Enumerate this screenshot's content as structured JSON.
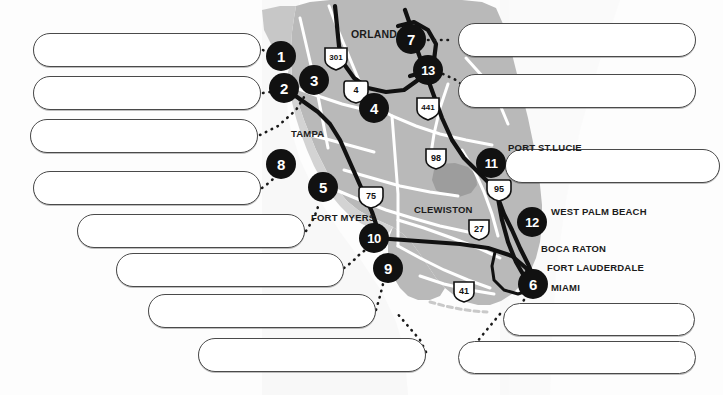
{
  "document": {
    "title": "Florida Numbered Location Map with Blank Callouts",
    "type": "map"
  },
  "map": {
    "region_name": "Florida",
    "land_color": "#b9b9b9",
    "land_highlight_color": "#a3a3a3",
    "water_color": "#f2f2f2",
    "road_major_color": "#111111",
    "road_minor_color": "#ffffff",
    "marker_color": "#111111",
    "marker_text_color": "#ffffff",
    "callout_fill": "#ffffff",
    "callout_border": "#4a4a4a",
    "label_color": "#1b1b1b"
  },
  "markers": [
    {
      "id": "marker-1",
      "label": "1",
      "x": 281,
      "y": 56,
      "r": 15
    },
    {
      "id": "marker-2",
      "label": "2",
      "x": 284,
      "y": 88,
      "r": 15
    },
    {
      "id": "marker-3",
      "label": "3",
      "x": 314,
      "y": 80,
      "r": 15
    },
    {
      "id": "marker-4",
      "label": "4",
      "x": 374,
      "y": 108,
      "r": 15
    },
    {
      "id": "marker-5",
      "label": "5",
      "x": 323,
      "y": 187,
      "r": 15
    },
    {
      "id": "marker-6",
      "label": "6",
      "x": 533,
      "y": 284,
      "r": 15
    },
    {
      "id": "marker-7",
      "label": "7",
      "x": 411,
      "y": 39,
      "r": 15
    },
    {
      "id": "marker-8",
      "label": "8",
      "x": 281,
      "y": 164,
      "r": 15
    },
    {
      "id": "marker-9",
      "label": "9",
      "x": 388,
      "y": 268,
      "r": 15
    },
    {
      "id": "marker-10",
      "label": "10",
      "x": 374,
      "y": 238,
      "r": 15
    },
    {
      "id": "marker-11",
      "label": "11",
      "x": 491,
      "y": 163,
      "r": 15
    },
    {
      "id": "marker-12",
      "label": "12",
      "x": 532,
      "y": 222,
      "r": 15
    },
    {
      "id": "marker-13",
      "label": "13",
      "x": 428,
      "y": 70,
      "r": 15
    }
  ],
  "city_labels": [
    {
      "id": "city-orlando",
      "text": "ORLANDO",
      "x": 351,
      "y": 28,
      "size": 10.5
    },
    {
      "id": "city-tampa",
      "text": "TAMPA",
      "x": 291,
      "y": 128,
      "size": 9.5
    },
    {
      "id": "city-fort-myers",
      "text": "FORT MYERS",
      "x": 311,
      "y": 212,
      "size": 9.5
    },
    {
      "id": "city-clewiston",
      "text": "CLEWISTON",
      "x": 414,
      "y": 204,
      "size": 9.5
    },
    {
      "id": "city-port-st-lucie",
      "text": "PORT ST.LUCIE",
      "x": 508,
      "y": 142,
      "size": 9.5
    },
    {
      "id": "city-west-palm-beach",
      "text": "WEST PALM BEACH",
      "x": 551,
      "y": 206,
      "size": 9.5
    },
    {
      "id": "city-boca-raton",
      "text": "BOCA RATON",
      "x": 541,
      "y": 243,
      "size": 9.5
    },
    {
      "id": "city-fort-lauderdale",
      "text": "FORT LAUDERDALE",
      "x": 547,
      "y": 262,
      "size": 9.5
    },
    {
      "id": "city-miami",
      "text": "MIAMI",
      "x": 551,
      "y": 282,
      "size": 9.5
    }
  ],
  "highway_shields": [
    {
      "id": "shield-301",
      "label": "301",
      "x": 336,
      "y": 57,
      "kind": "us",
      "w": 22,
      "h": 20
    },
    {
      "id": "shield-4",
      "label": "4",
      "x": 356,
      "y": 90,
      "kind": "interstate",
      "w": 20,
      "h": 19
    },
    {
      "id": "shield-441",
      "label": "441",
      "x": 428,
      "y": 107,
      "kind": "us",
      "w": 22,
      "h": 20
    },
    {
      "id": "shield-98",
      "label": "98",
      "x": 436,
      "y": 158,
      "kind": "us",
      "w": 20,
      "h": 19
    },
    {
      "id": "shield-95",
      "label": "95",
      "x": 499,
      "y": 189,
      "kind": "interstate",
      "w": 20,
      "h": 19
    },
    {
      "id": "shield-27",
      "label": "27",
      "x": 479,
      "y": 229,
      "kind": "us",
      "w": 20,
      "h": 19
    },
    {
      "id": "shield-75",
      "label": "75",
      "x": 371,
      "y": 196,
      "kind": "interstate",
      "w": 20,
      "h": 19
    },
    {
      "id": "shield-41",
      "label": "41",
      "x": 464,
      "y": 291,
      "kind": "us",
      "w": 20,
      "h": 19
    }
  ],
  "callouts": [
    {
      "id": "callout-1",
      "text": "",
      "placeholder": "",
      "x": 33,
      "y": 33,
      "w": 228,
      "h": 34,
      "side": "left",
      "marker": "1"
    },
    {
      "id": "callout-2",
      "text": "",
      "placeholder": "",
      "x": 33,
      "y": 76,
      "w": 228,
      "h": 34,
      "side": "left",
      "marker": "2"
    },
    {
      "id": "callout-3",
      "text": "",
      "placeholder": "",
      "x": 30,
      "y": 119,
      "w": 228,
      "h": 34,
      "side": "left",
      "marker": "3"
    },
    {
      "id": "callout-8",
      "text": "",
      "placeholder": "",
      "x": 33,
      "y": 171,
      "w": 228,
      "h": 34,
      "side": "left",
      "marker": "8"
    },
    {
      "id": "callout-5",
      "text": "",
      "placeholder": "",
      "x": 77,
      "y": 214,
      "w": 228,
      "h": 34,
      "side": "left",
      "marker": "5"
    },
    {
      "id": "callout-10",
      "text": "",
      "placeholder": "",
      "x": 116,
      "y": 253,
      "w": 228,
      "h": 34,
      "side": "left",
      "marker": "10"
    },
    {
      "id": "callout-9",
      "text": "",
      "placeholder": "",
      "x": 148,
      "y": 294,
      "w": 228,
      "h": 34,
      "side": "left",
      "marker": "9"
    },
    {
      "id": "callout-b1",
      "text": "",
      "placeholder": "",
      "x": 198,
      "y": 338,
      "w": 228,
      "h": 34,
      "side": "left",
      "marker": ""
    },
    {
      "id": "callout-7",
      "text": "",
      "placeholder": "",
      "x": 458,
      "y": 23,
      "w": 238,
      "h": 34,
      "side": "right",
      "marker": "7"
    },
    {
      "id": "callout-13",
      "text": "",
      "placeholder": "",
      "x": 458,
      "y": 74,
      "w": 238,
      "h": 34,
      "side": "right",
      "marker": "13"
    },
    {
      "id": "callout-11",
      "text": "",
      "placeholder": "",
      "x": 505,
      "y": 149,
      "w": 215,
      "h": 34,
      "side": "right",
      "marker": "11"
    },
    {
      "id": "callout-6",
      "text": "",
      "placeholder": "",
      "x": 503,
      "y": 303,
      "w": 192,
      "h": 33,
      "side": "right",
      "marker": "6"
    },
    {
      "id": "callout-b2",
      "text": "",
      "placeholder": "",
      "x": 458,
      "y": 341,
      "w": 238,
      "h": 33,
      "side": "right",
      "marker": ""
    }
  ]
}
